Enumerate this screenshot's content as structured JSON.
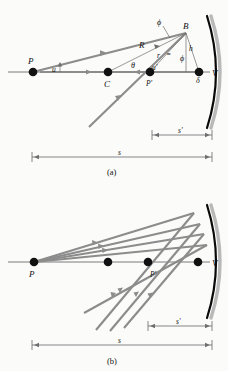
{
  "figure": {
    "background_color": "#fbfbfa",
    "ray_color": "#8c8c8c",
    "mirror_color": "#0a0a0a",
    "mirror_shadow_color": "#b9b9b9"
  },
  "panel_a": {
    "caption": "(a)",
    "points": {
      "P": "P",
      "C": "C",
      "P_prime": "P'",
      "V": "V",
      "B": "B"
    },
    "angles": {
      "u": "u",
      "u_prime": "u'",
      "theta": "θ",
      "phi_top": "ϕ",
      "phi_right": "ϕ",
      "delta": "δ"
    },
    "lengths": {
      "R": "R",
      "r": "r",
      "h": "h",
      "equals": "=",
      "s": "s",
      "s_prime": "s'"
    }
  },
  "panel_b": {
    "caption": "(b)",
    "points": {
      "P": "P",
      "P_prime": "P'",
      "V": "V"
    },
    "lengths": {
      "s": "s",
      "s_prime": "s'"
    }
  }
}
